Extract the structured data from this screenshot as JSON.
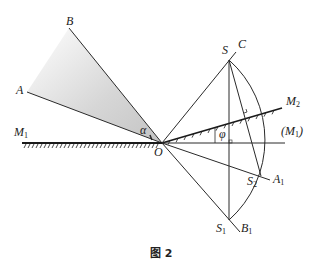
{
  "figure": {
    "caption": "图 2",
    "colors": {
      "line": "#2a2a2a",
      "shade": "#d9d9d9",
      "background": "#ffffff"
    },
    "labels": {
      "B": "B",
      "A": "A",
      "M1": "M",
      "M1_sub": "1",
      "M2": "M",
      "M2_sub": "2",
      "M1_paren_open": "(M",
      "M1_paren_sub": "1",
      "M1_paren_close": ")",
      "alpha": "α",
      "phi": "φ",
      "O": "O",
      "S": "S",
      "C": "C",
      "S2": "S",
      "S2_sub": "2",
      "A1": "A",
      "A1_sub": "1",
      "S1": "S",
      "S1_sub": "1",
      "B1": "B",
      "B1_sub": "1"
    }
  }
}
